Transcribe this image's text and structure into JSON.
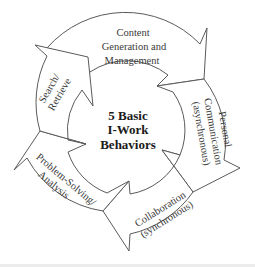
{
  "diagram": {
    "center_title": {
      "line1": "5 Basic",
      "line2": "I-Work",
      "line3": "Behaviors"
    },
    "behaviors": [
      {
        "id": "content",
        "lines": [
          "Content",
          "Generation and",
          "Management"
        ]
      },
      {
        "id": "personal",
        "lines": [
          "Personal",
          "Communication",
          "(asynchronous)"
        ]
      },
      {
        "id": "collab",
        "lines": [
          "Collaboration",
          "(synchronous)"
        ]
      },
      {
        "id": "problem",
        "lines": [
          "Problem-Solving/",
          "Analysis"
        ]
      },
      {
        "id": "search",
        "lines": [
          "Search/",
          "Retrieve"
        ]
      }
    ],
    "flow_direction": "clockwise",
    "colors": {
      "stroke": "#5a5a5a",
      "fill": "#ffffff",
      "text": "#3a3a3a"
    }
  }
}
